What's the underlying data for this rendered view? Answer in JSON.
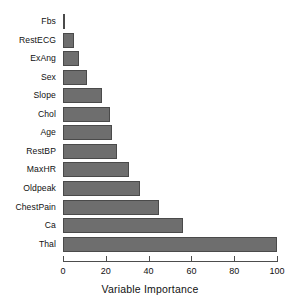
{
  "chart_data": {
    "type": "bar",
    "orientation": "horizontal",
    "title": "",
    "xlabel": "Variable Importance",
    "ylabel": "",
    "categories": [
      "Fbs",
      "RestECG",
      "ExAng",
      "Sex",
      "Slope",
      "Chol",
      "Age",
      "RestBP",
      "MaxHR",
      "Oldpeak",
      "ChestPain",
      "Ca",
      "Thal"
    ],
    "values": [
      1,
      5,
      7.5,
      11,
      18,
      22,
      23,
      25,
      31,
      36,
      45,
      56,
      100
    ],
    "xlim": [
      0,
      100
    ],
    "xticks": [
      0,
      20,
      40,
      60,
      80,
      100
    ],
    "xtick_labels": [
      "0",
      "20",
      "40",
      "60",
      "80",
      "100"
    ],
    "grid": false,
    "legend": false,
    "bar_fill_color": "#6e6e6e",
    "bar_border_color": "#4a4a4a",
    "axis_color": "#4d4d4d",
    "background_color": "#ffffff"
  }
}
